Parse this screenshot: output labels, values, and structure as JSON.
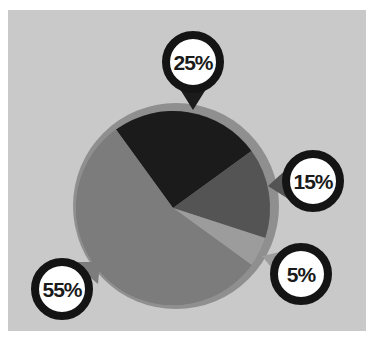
{
  "chart_data": {
    "type": "pie",
    "title": "",
    "categories": [
      "Segment A",
      "Segment B",
      "Segment C",
      "Segment D"
    ],
    "values": [
      25,
      15,
      5,
      55
    ],
    "labels": [
      "25%",
      "15%",
      "5%",
      "55%"
    ],
    "colors": [
      "#1b1b1b",
      "#545454",
      "#9c9c9c",
      "#7c7c7c"
    ],
    "start_angle_deg": -36,
    "legend": "none",
    "annotations": "circular callout badges with pointers to each slice"
  },
  "badges": [
    {
      "label": "25%",
      "cx": 193,
      "cy": 62
    },
    {
      "label": "15%",
      "cx": 313,
      "cy": 181
    },
    {
      "label": "5%",
      "cx": 301,
      "cy": 274
    },
    {
      "label": "55%",
      "cx": 62,
      "cy": 289
    }
  ],
  "style": {
    "background": "#c9c9c9",
    "ring": "#8f8f8f",
    "badge_ring": "#141414",
    "badge_fill": "#ffffff"
  }
}
